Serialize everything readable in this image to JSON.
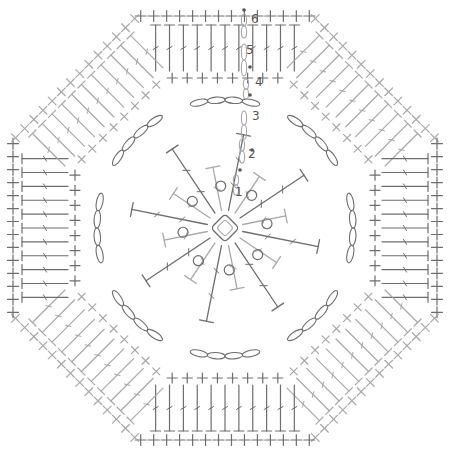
{
  "diagram": {
    "center": [
      225,
      228
    ],
    "colors": {
      "dark": "#6e6e6e",
      "light": "#a8a8a8",
      "dot": "#555555",
      "background": "#ffffff"
    },
    "round_labels": [
      {
        "text": "1",
        "x": 235,
        "y": 196
      },
      {
        "text": "2",
        "x": 248,
        "y": 158
      },
      {
        "text": "3",
        "x": 252,
        "y": 120
      },
      {
        "text": "4",
        "x": 255,
        "y": 86
      },
      {
        "text": "5",
        "x": 246,
        "y": 54
      },
      {
        "text": "6",
        "x": 251,
        "y": 23
      }
    ],
    "rounds": [
      {
        "round": 1,
        "stitch": "dc",
        "count": 16,
        "inner": 18,
        "outer": 62
      },
      {
        "round": 2,
        "stitch": "tr",
        "count": 16,
        "inner": 18,
        "outer": 95
      },
      {
        "round": 3,
        "stitch": "ch-arch",
        "count": 8,
        "radius": 128
      },
      {
        "round": 4,
        "stitch": "sc",
        "per_side": 8,
        "apothem": 150
      },
      {
        "round": 5,
        "stitch": "dc",
        "per_side": 11,
        "apothem": 182
      },
      {
        "round": 6,
        "stitch": "sc",
        "per_side": 14,
        "apothem": 212
      }
    ]
  }
}
